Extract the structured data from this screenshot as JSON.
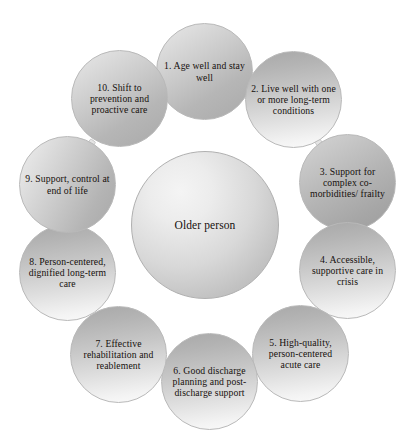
{
  "diagram": {
    "type": "radial-hub-and-spoke",
    "center": {
      "id": "center",
      "label": "Older\nperson",
      "label_line1": "Older",
      "label_line2": "person"
    },
    "nodes": [
      {
        "number": "1",
        "id": "node-1",
        "label": "1. Age well and stay well",
        "position": "top"
      },
      {
        "number": "2",
        "id": "node-2",
        "label": "2. Live well with one or more long-term conditions",
        "position": "upper-right"
      },
      {
        "number": "3",
        "id": "node-3",
        "label": "3. Support for complex co-morbidities/ frailty",
        "position": "right-upper"
      },
      {
        "number": "4",
        "id": "node-4",
        "label": "4. Accessible, supportive care in crisis",
        "position": "right-lower"
      },
      {
        "number": "5",
        "id": "node-5",
        "label": "5. High-quality, person-centered acute care",
        "position": "lower-right"
      },
      {
        "number": "6",
        "id": "node-6",
        "label": "6. Good discharge planning and post-discharge support",
        "position": "bottom"
      },
      {
        "number": "7",
        "id": "node-7",
        "label": "7. Effective rehabilitation and reablement",
        "position": "lower-left"
      },
      {
        "number": "8",
        "id": "node-8",
        "label": "8. Person-centered, dignified long-term care",
        "position": "left-lower"
      },
      {
        "number": "9",
        "id": "node-9",
        "label": "9. Support, control at end of life",
        "position": "left-upper"
      },
      {
        "number": "10",
        "id": "node-10",
        "label": "10. Shift to prevention and proactive care",
        "position": "upper-left"
      }
    ],
    "colors": {
      "background": "#ffffff",
      "text": "#16100d",
      "circle_light": "#eeeeee",
      "circle_mid": "#c6c6c6",
      "circle_dark": "#a2a2a2",
      "outline": "#b9b9b9",
      "connector": "#e4e4e4"
    }
  }
}
